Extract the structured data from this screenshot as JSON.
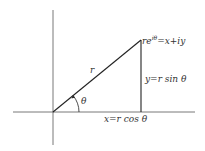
{
  "diagram": {
    "type": "polar-form-complex-number",
    "labels": {
      "point": "re",
      "point_exp": "iθ",
      "point_eq": "=x+iy",
      "radius": "r",
      "angle": "θ",
      "vertical": "y=r sin θ",
      "horizontal": "x=r cos θ"
    },
    "colors": {
      "line": "#222222",
      "text": "#333333",
      "background": "#ffffff"
    }
  }
}
